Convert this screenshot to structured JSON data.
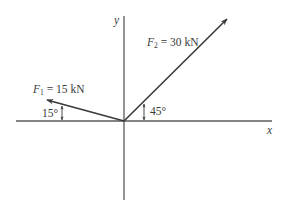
{
  "diagram": {
    "type": "force-vector-diagram",
    "axes": {
      "x_label": "x",
      "y_label": "y"
    },
    "forces": [
      {
        "symbol": "F",
        "subscript": "1",
        "equals": "= 15 kN",
        "magnitude": 15,
        "unit": "kN",
        "angle_label": "15°",
        "angle_deg": 15,
        "reference": "above negative x-axis"
      },
      {
        "symbol": "F",
        "subscript": "2",
        "equals": "= 30 kN",
        "magnitude": 30,
        "unit": "kN",
        "angle_label": "45°",
        "angle_deg": 45,
        "reference": "above positive x-axis"
      }
    ],
    "colors": {
      "line": "#555555",
      "vector": "#3a3a3a",
      "text": "#3a3a3a",
      "background": "#ffffff"
    }
  }
}
